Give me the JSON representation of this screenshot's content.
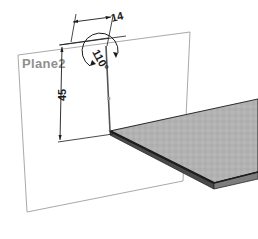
{
  "drawing": {
    "type": "cad-sketch-3d",
    "background_color": "#ffffff",
    "plane": {
      "label": "Plane2",
      "label_color": "#8f8f8f",
      "outline_color": "#a9a9a9",
      "corners": [
        [
          18,
          55
        ],
        [
          190,
          32
        ],
        [
          183,
          181
        ],
        [
          27,
          212
        ]
      ]
    },
    "plate": {
      "name": "extruded-plate",
      "fill_color": "#b0b0b0",
      "edge_color": "#2b2b2b",
      "thickness_color": "#3a3a3a",
      "top_face": [
        [
          110,
          131
        ],
        [
          258,
          100
        ],
        [
          258,
          176
        ],
        [
          213,
          185
        ]
      ],
      "apex": [
        110,
        131
      ]
    },
    "dimensions": [
      {
        "name": "length-14",
        "value": "14",
        "kind": "linear",
        "x": 112,
        "y": 20,
        "rotation": -20
      },
      {
        "name": "height-45",
        "value": "45",
        "kind": "linear",
        "x": 66,
        "y": 97,
        "rotation": -90
      },
      {
        "name": "angle-110",
        "value": "110°",
        "kind": "angular",
        "x": 98,
        "y": 58,
        "rotation": 62
      }
    ],
    "line_colors": {
      "dimension": "#1a1a1a",
      "construction": "#6e6e6e",
      "sketch": "#555555"
    }
  }
}
